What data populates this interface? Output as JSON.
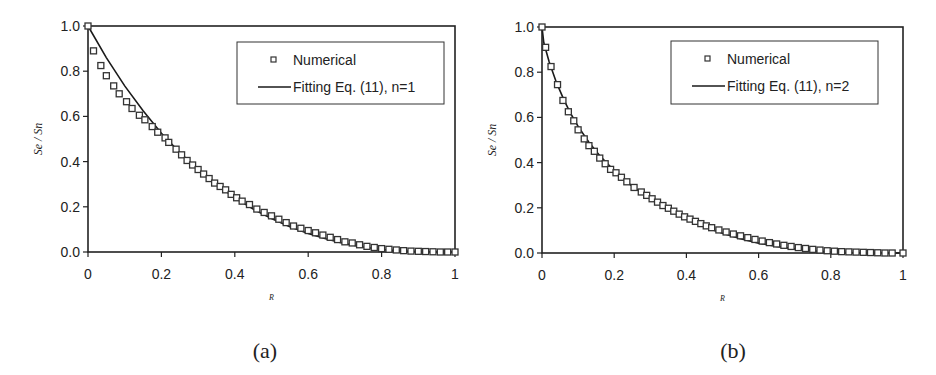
{
  "figure": {
    "panels": [
      {
        "caption": "(a)",
        "ylabel": "Se / Sn",
        "xlabel": "R",
        "y_ticks": [
          "0.0",
          "0.2",
          "0.4",
          "0.6",
          "0.8",
          "1.0"
        ],
        "x_ticks": [
          "0",
          "0.2",
          "0.4",
          "0.6",
          "0.8",
          "1"
        ],
        "legend": {
          "marker_label": "Numerical",
          "line_label": "Fitting Eq. (11), n=1"
        }
      },
      {
        "caption": "(b)",
        "ylabel": "Se / Sn",
        "xlabel": "R",
        "y_ticks": [
          "0.0",
          "0.2",
          "0.4",
          "0.6",
          "0.8",
          "1.0"
        ],
        "x_ticks": [
          "0",
          "0.2",
          "0.4",
          "0.6",
          "0.8",
          "1"
        ],
        "legend": {
          "marker_label": "Numerical",
          "line_label": "Fitting Eq. (11), n=2"
        }
      }
    ]
  },
  "chart_data": [
    {
      "type": "scatter",
      "title": "(a)",
      "xlabel": "R",
      "ylabel": "Se/Sn",
      "xlim": [
        0,
        1
      ],
      "ylim": [
        0,
        1.0
      ],
      "x_ticks": [
        0,
        0.2,
        0.4,
        0.6,
        0.8,
        1
      ],
      "y_ticks": [
        0.0,
        0.2,
        0.4,
        0.6,
        0.8,
        1.0
      ],
      "grid": false,
      "legend_position": "upper right",
      "series": [
        {
          "name": "Numerical",
          "style": "open-square-markers",
          "x": [
            0,
            0.015,
            0.035,
            0.05,
            0.07,
            0.085,
            0.105,
            0.12,
            0.14,
            0.155,
            0.175,
            0.19,
            0.21,
            0.22,
            0.24,
            0.255,
            0.27,
            0.285,
            0.3,
            0.315,
            0.33,
            0.345,
            0.36,
            0.375,
            0.39,
            0.405,
            0.42,
            0.44,
            0.46,
            0.48,
            0.5,
            0.52,
            0.54,
            0.56,
            0.58,
            0.6,
            0.62,
            0.64,
            0.66,
            0.68,
            0.7,
            0.72,
            0.74,
            0.76,
            0.78,
            0.8,
            0.82,
            0.84,
            0.86,
            0.88,
            0.9,
            0.92,
            0.94,
            0.96,
            0.98,
            1.0
          ],
          "y": [
            1.0,
            0.89,
            0.825,
            0.78,
            0.735,
            0.7,
            0.665,
            0.635,
            0.605,
            0.585,
            0.555,
            0.53,
            0.505,
            0.485,
            0.455,
            0.43,
            0.405,
            0.385,
            0.365,
            0.345,
            0.325,
            0.305,
            0.29,
            0.275,
            0.255,
            0.24,
            0.225,
            0.21,
            0.19,
            0.175,
            0.16,
            0.145,
            0.13,
            0.115,
            0.105,
            0.095,
            0.085,
            0.075,
            0.065,
            0.055,
            0.045,
            0.04,
            0.032,
            0.025,
            0.02,
            0.015,
            0.012,
            0.009,
            0.006,
            0.004,
            0.003,
            0.002,
            0.001,
            0.0,
            0.0,
            0.0
          ]
        },
        {
          "name": "Fitting Eq. (11), n=1",
          "style": "solid-line",
          "x": [
            0,
            0.05,
            0.1,
            0.15,
            0.2,
            0.25,
            0.3,
            0.35,
            0.4,
            0.45,
            0.5,
            0.55,
            0.6,
            0.65,
            0.7,
            0.75,
            0.8,
            0.85,
            0.9,
            0.95,
            1.0
          ],
          "y": [
            1.0,
            0.86,
            0.735,
            0.625,
            0.525,
            0.44,
            0.365,
            0.3,
            0.24,
            0.19,
            0.148,
            0.112,
            0.082,
            0.057,
            0.037,
            0.022,
            0.011,
            0.005,
            0.002,
            0.0,
            0.0
          ]
        }
      ]
    },
    {
      "type": "scatter",
      "title": "(b)",
      "xlabel": "R",
      "ylabel": "Se/Sn",
      "xlim": [
        0,
        1
      ],
      "ylim": [
        0,
        1.0
      ],
      "x_ticks": [
        0,
        0.2,
        0.4,
        0.6,
        0.8,
        1
      ],
      "y_ticks": [
        0.0,
        0.2,
        0.4,
        0.6,
        0.8,
        1.0
      ],
      "grid": false,
      "legend_position": "upper right",
      "series": [
        {
          "name": "Numerical",
          "style": "open-square-markers",
          "x": [
            0,
            0.01,
            0.025,
            0.043,
            0.058,
            0.073,
            0.088,
            0.1,
            0.117,
            0.13,
            0.145,
            0.16,
            0.175,
            0.19,
            0.205,
            0.22,
            0.235,
            0.255,
            0.275,
            0.29,
            0.305,
            0.32,
            0.335,
            0.35,
            0.365,
            0.38,
            0.395,
            0.41,
            0.425,
            0.44,
            0.455,
            0.47,
            0.49,
            0.51,
            0.53,
            0.55,
            0.57,
            0.59,
            0.61,
            0.63,
            0.65,
            0.67,
            0.69,
            0.71,
            0.73,
            0.75,
            0.77,
            0.79,
            0.81,
            0.83,
            0.85,
            0.87,
            0.89,
            0.91,
            0.93,
            0.95,
            0.97,
            1.0
          ],
          "y": [
            1.0,
            0.91,
            0.825,
            0.745,
            0.675,
            0.625,
            0.585,
            0.545,
            0.505,
            0.475,
            0.45,
            0.42,
            0.395,
            0.37,
            0.355,
            0.335,
            0.315,
            0.29,
            0.27,
            0.255,
            0.24,
            0.225,
            0.21,
            0.198,
            0.185,
            0.172,
            0.16,
            0.15,
            0.14,
            0.13,
            0.12,
            0.112,
            0.102,
            0.093,
            0.084,
            0.076,
            0.068,
            0.06,
            0.053,
            0.046,
            0.04,
            0.034,
            0.029,
            0.024,
            0.02,
            0.016,
            0.013,
            0.01,
            0.008,
            0.006,
            0.005,
            0.004,
            0.003,
            0.002,
            0.001,
            0.0,
            0.0,
            0.0
          ]
        },
        {
          "name": "Fitting Eq. (11), n=2",
          "style": "solid-line",
          "x": [
            0,
            0.005,
            0.02,
            0.04,
            0.06,
            0.08,
            0.1,
            0.13,
            0.16,
            0.2,
            0.25,
            0.3,
            0.35,
            0.4,
            0.45,
            0.5,
            0.55,
            0.6,
            0.65,
            0.7,
            0.75,
            0.8,
            0.85,
            0.9,
            0.95,
            1.0
          ],
          "y": [
            1.0,
            0.93,
            0.845,
            0.755,
            0.68,
            0.615,
            0.56,
            0.49,
            0.43,
            0.365,
            0.295,
            0.24,
            0.192,
            0.15,
            0.115,
            0.087,
            0.063,
            0.044,
            0.029,
            0.018,
            0.01,
            0.005,
            0.002,
            0.001,
            0.0,
            0.0
          ]
        }
      ]
    }
  ]
}
